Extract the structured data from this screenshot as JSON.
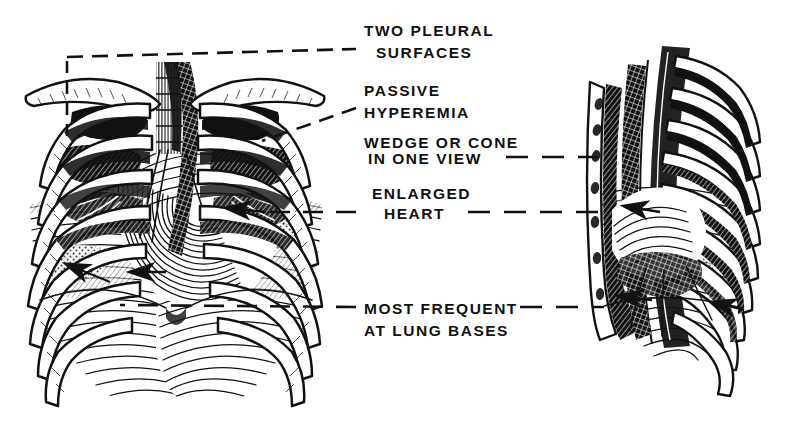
{
  "figure": {
    "background_color": "#ffffff",
    "ink_color": "#111111",
    "views": [
      {
        "name": "frontal-view",
        "label": "Frontal (PA) thorax view",
        "side": "left"
      },
      {
        "name": "lateral-view",
        "label": "Lateral thorax view",
        "side": "right"
      }
    ]
  },
  "annotations": [
    {
      "id": "two-pleural-surfaces",
      "lines": [
        "TWO PLEURAL",
        "SURFACES"
      ],
      "x": 364,
      "y": 36,
      "line_height": 22
    },
    {
      "id": "passive-hyperemia",
      "lines": [
        "PASSIVE",
        "HYPEREMIA"
      ],
      "x": 364,
      "y": 96,
      "line_height": 22
    },
    {
      "id": "wedge-or-cone-in-one-view",
      "lines": [
        "WEDGE OR CONE",
        "IN ONE VIEW"
      ],
      "x": 364,
      "y": 148,
      "line_height": 22
    },
    {
      "id": "enlarged-heart",
      "lines": [
        "ENLARGED",
        "HEART"
      ],
      "x": 372,
      "y": 199,
      "line_height": 22
    },
    {
      "id": "most-frequent-at-lung-bases",
      "lines": [
        "MOST FREQUENT",
        "AT LUNG BASES"
      ],
      "x": 364,
      "y": 317,
      "line_height": 22
    }
  ],
  "leaders": [
    {
      "id": "leader-two-pleural-surfaces",
      "description": "bracket from top-left of frontal view running right to the label"
    },
    {
      "id": "leader-passive-hyperemia",
      "description": "diagonal dashed leader from label down-left into right lung field"
    },
    {
      "id": "leader-wedge-or-cone",
      "description": "dashed leader from label right to the lateral view"
    },
    {
      "id": "leader-enlarged-heart",
      "description": "dashed leader running left into the cardiac silhouette and right to the lateral view"
    },
    {
      "id": "leader-lung-bases",
      "description": "dashed leader running left across the diaphragm and right to the lateral view base"
    }
  ],
  "colors": {
    "ink": "#111111",
    "paper": "#ffffff"
  }
}
